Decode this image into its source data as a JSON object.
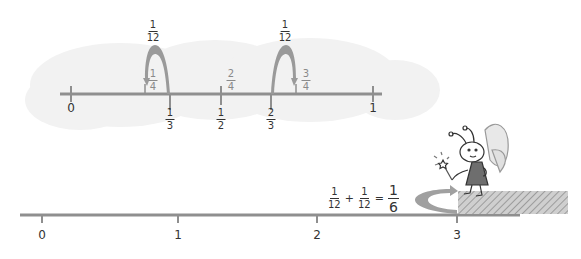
{
  "top_line": {
    "ticks_below": [
      {
        "label": "0",
        "type": "whole",
        "x": 71
      },
      {
        "num": "1",
        "den": "3",
        "x": 170
      },
      {
        "num": "1",
        "den": "2",
        "x": 221
      },
      {
        "num": "2",
        "den": "3",
        "x": 271
      },
      {
        "label": "1",
        "type": "whole",
        "x": 373
      }
    ],
    "ticks_above": [
      {
        "num": "1",
        "den": "4",
        "x": 147
      },
      {
        "num": "2",
        "den": "4",
        "x": 221
      },
      {
        "num": "3",
        "den": "4",
        "x": 297
      }
    ],
    "jumps": [
      {
        "num": "1",
        "den": "12",
        "from_x": 170,
        "to_x": 145,
        "label_x": 153
      },
      {
        "num": "1",
        "den": "12",
        "from_x": 271,
        "to_x": 296,
        "label_x": 285
      }
    ]
  },
  "bottom_line": {
    "ticks": [
      {
        "label": "0",
        "x": 42
      },
      {
        "label": "1",
        "x": 178
      },
      {
        "label": "2",
        "x": 317
      },
      {
        "label": "3",
        "x": 457
      }
    ]
  },
  "equation": {
    "term1": {
      "num": "1",
      "den": "12"
    },
    "plus": "+",
    "term2": {
      "num": "1",
      "den": "12"
    },
    "equals": "=",
    "result": {
      "num": "1",
      "den": "6"
    }
  },
  "colors": {
    "line": "#8f8f8f",
    "arrow": "#9a9a9a",
    "cloud": "#f1f1f1",
    "hatch": "#b5b5b5",
    "text": "#333333"
  },
  "character": {
    "name": "fairy-bee-with-wand"
  }
}
